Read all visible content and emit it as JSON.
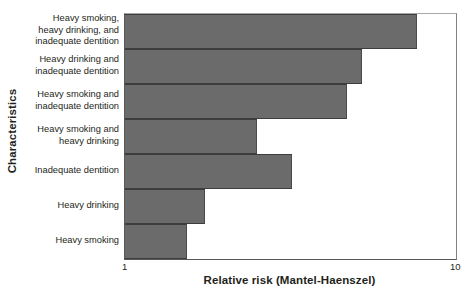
{
  "chart_data": {
    "type": "bar",
    "orientation": "horizontal",
    "title": "",
    "xlabel": "Relative risk (Mantel-Haenszel)",
    "ylabel": "Characteristics",
    "xscale": "log",
    "xlim": [
      1,
      10
    ],
    "xticks": [
      "1",
      "10"
    ],
    "grid": false,
    "legend": null,
    "bar_color": "#6b6b6b",
    "categories": [
      "Heavy smoking, heavy drinking, and inadequate dentition",
      "Heavy drinking and inadequate dentition",
      "Heavy smoking and inadequate dentition",
      "Heavy smoking and heavy drinking",
      "Inadequate dentition",
      "Heavy drinking",
      "Heavy smoking"
    ],
    "values": [
      7.6,
      5.2,
      4.7,
      2.5,
      3.2,
      1.75,
      1.54
    ]
  },
  "axes": {
    "y_title": "Characteristics",
    "x_title": "Relative risk (Mantel-Haenszel)",
    "x_tick_min": "1",
    "x_tick_max": "10"
  },
  "categories": [
    {
      "lines": [
        "Heavy smoking,",
        "heavy drinking, and",
        "inadequate dentition"
      ],
      "value": 7.6
    },
    {
      "lines": [
        "Heavy drinking and",
        "inadequate dentition"
      ],
      "value": 5.2
    },
    {
      "lines": [
        "Heavy smoking and",
        "inadequate dentition"
      ],
      "value": 4.7
    },
    {
      "lines": [
        "Heavy smoking and",
        "heavy drinking"
      ],
      "value": 2.5
    },
    {
      "lines": [
        "Inadequate dentition"
      ],
      "value": 3.2
    },
    {
      "lines": [
        "Heavy drinking"
      ],
      "value": 1.75
    },
    {
      "lines": [
        "Heavy smoking"
      ],
      "value": 1.54
    }
  ]
}
